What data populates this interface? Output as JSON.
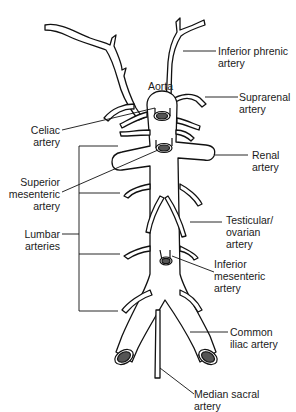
{
  "diagram": {
    "colors": {
      "stroke": "#111111",
      "lumen": "#555555",
      "background": "#ffffff"
    },
    "labels": {
      "aorta": "Aorta",
      "inferior_phrenic": "Inferior phrenic\nartery",
      "suprarenal": "Suprarenal\nartery",
      "celiac": "Celiac\nartery",
      "renal": "Renal\nartery",
      "superior_mesenteric": "Superior\nmesenteric\nartery",
      "testicular_ovarian": "Testicular/\novarian\nartery",
      "lumbar": "Lumbar\narteries",
      "inferior_mesenteric": "Inferior\nmesenteric\nartery",
      "common_iliac": "Common\niliac artery",
      "median_sacral": "Median sacral\nartery"
    }
  }
}
